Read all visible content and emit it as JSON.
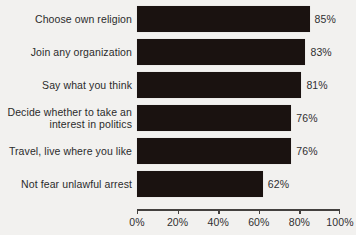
{
  "chart_data": {
    "type": "bar",
    "orientation": "horizontal",
    "title": "",
    "subtitle": "",
    "xlabel": "",
    "ylabel": "",
    "xlim": [
      0,
      100
    ],
    "xticks": [
      0,
      20,
      40,
      60,
      80,
      100
    ],
    "xtick_labels": [
      "0%",
      "20%",
      "40%",
      "60%",
      "80%",
      "100%"
    ],
    "grid": false,
    "legend": null,
    "bar_color": "#1a1210",
    "background_color": "#f2f1ef",
    "text_color": "#2b2b2b",
    "categories": [
      "Choose own religion",
      "Join any organization",
      "Say what you think",
      "Decide whether to take an\ninterest in politics",
      "Travel, live where you like",
      "Not fear unlawful arrest"
    ],
    "values": [
      85,
      83,
      81,
      76,
      76,
      62
    ],
    "value_labels": [
      "85%",
      "83%",
      "81%",
      "76%",
      "76%",
      "62%"
    ]
  }
}
